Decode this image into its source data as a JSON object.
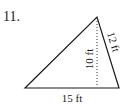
{
  "problem": {
    "number": "11."
  },
  "triangle": {
    "vertices": {
      "apex": [
        97,
        17
      ],
      "bottom_left": [
        25,
        88
      ],
      "bottom_right": [
        119,
        88
      ]
    },
    "base_label": "15 ft",
    "height_label": "10 ft",
    "side_label": "12 ft",
    "stroke_color": "#1a1a1a",
    "altitude_style": "dotted"
  }
}
